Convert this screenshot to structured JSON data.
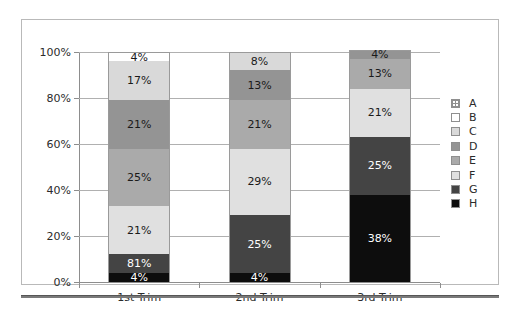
{
  "chart_data": {
    "type": "bar",
    "subtype": "stacked-100-percent",
    "title": "",
    "xlabel": "",
    "ylabel": "",
    "categories": [
      "1st Trim",
      "2nd Trim",
      "3rd Trim"
    ],
    "ylim": [
      0,
      100
    ],
    "ytick_labels": [
      "0%",
      "20%",
      "40%",
      "60%",
      "80%",
      "100%"
    ],
    "ytick_values": [
      0,
      20,
      40,
      60,
      80,
      100
    ],
    "grid": true,
    "legend_position": "right",
    "legend_entries": [
      "A",
      "B",
      "C",
      "D",
      "E",
      "F",
      "G",
      "H"
    ],
    "series": [
      {
        "name": "A",
        "color": "#f2f2f2",
        "pattern": "dotted",
        "values": [
          0,
          0,
          0
        ],
        "labels": [
          "",
          "",
          ""
        ]
      },
      {
        "name": "B",
        "color": "#ffffff",
        "pattern": "solid",
        "values": [
          4,
          0,
          0
        ],
        "labels": [
          "4%",
          "",
          ""
        ]
      },
      {
        "name": "C",
        "color": "#d9d9d9",
        "pattern": "solid",
        "values": [
          17,
          8,
          0
        ],
        "labels": [
          "17%",
          "8%",
          ""
        ]
      },
      {
        "name": "D",
        "color": "#949494",
        "pattern": "solid",
        "values": [
          21,
          13,
          4
        ],
        "labels": [
          "21%",
          "13%",
          "4%"
        ]
      },
      {
        "name": "E",
        "color": "#aaaaaa",
        "pattern": "solid",
        "values": [
          25,
          21,
          13
        ],
        "labels": [
          "25%",
          "21%",
          "13%"
        ]
      },
      {
        "name": "F",
        "color": "#e0e0e0",
        "pattern": "solid",
        "values": [
          21,
          29,
          21
        ],
        "labels": [
          "21%",
          "29%",
          "21%"
        ]
      },
      {
        "name": "G",
        "color": "#444444",
        "pattern": "solid",
        "values": [
          8,
          25,
          25
        ],
        "labels": [
          "81%",
          "25%",
          "25%"
        ]
      },
      {
        "name": "H",
        "color": "#0d0d0d",
        "pattern": "solid",
        "values": [
          4,
          4,
          38
        ],
        "labels": [
          "4%",
          "4%",
          "38%"
        ]
      }
    ],
    "stack_order_bottom_to_top": [
      "H",
      "G",
      "F",
      "E",
      "D",
      "C",
      "B",
      "A"
    ],
    "bars": [
      {
        "category": "1st Trim",
        "segments": [
          {
            "series": "B",
            "value": 4,
            "label": "4%",
            "color": "#ffffff",
            "label_color": "dark"
          },
          {
            "series": "C",
            "value": 17,
            "label": "17%",
            "color": "#d9d9d9",
            "label_color": "dark"
          },
          {
            "series": "D",
            "value": 21,
            "label": "21%",
            "color": "#949494",
            "label_color": "dark"
          },
          {
            "series": "E",
            "value": 25,
            "label": "25%",
            "color": "#aaaaaa",
            "label_color": "dark"
          },
          {
            "series": "F",
            "value": 21,
            "label": "21%",
            "color": "#e0e0e0",
            "label_color": "dark"
          },
          {
            "series": "G",
            "value": 8,
            "label": "81%",
            "color": "#444444",
            "label_color": "light"
          },
          {
            "series": "H",
            "value": 4,
            "label": "4%",
            "color": "#0d0d0d",
            "label_color": "light"
          }
        ]
      },
      {
        "category": "2nd Trim",
        "segments": [
          {
            "series": "C",
            "value": 8,
            "label": "8%",
            "color": "#d9d9d9",
            "label_color": "dark"
          },
          {
            "series": "D",
            "value": 13,
            "label": "13%",
            "color": "#949494",
            "label_color": "dark"
          },
          {
            "series": "E",
            "value": 21,
            "label": "21%",
            "color": "#aaaaaa",
            "label_color": "dark"
          },
          {
            "series": "F",
            "value": 29,
            "label": "29%",
            "color": "#e0e0e0",
            "label_color": "dark"
          },
          {
            "series": "G",
            "value": 25,
            "label": "25%",
            "color": "#444444",
            "label_color": "light"
          },
          {
            "series": "H",
            "value": 4,
            "label": "4%",
            "color": "#0d0d0d",
            "label_color": "light"
          }
        ]
      },
      {
        "category": "3rd Trim",
        "segments": [
          {
            "series": "D",
            "value": 4,
            "label": "4%",
            "color": "#949494",
            "label_color": "dark"
          },
          {
            "series": "E",
            "value": 13,
            "label": "13%",
            "color": "#aaaaaa",
            "label_color": "dark"
          },
          {
            "series": "F",
            "value": 21,
            "label": "21%",
            "color": "#e0e0e0",
            "label_color": "dark"
          },
          {
            "series": "G",
            "value": 25,
            "label": "25%",
            "color": "#444444",
            "label_color": "light"
          },
          {
            "series": "H",
            "value": 38,
            "label": "38%",
            "color": "#0d0d0d",
            "label_color": "light"
          }
        ]
      }
    ]
  }
}
